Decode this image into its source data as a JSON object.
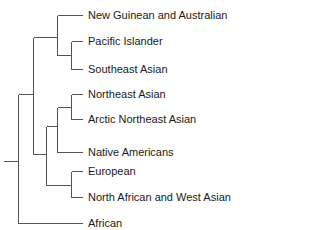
{
  "diagram": {
    "type": "phylogenetic-tree",
    "line_color": "#555555",
    "text_color": "#1a1a1a",
    "leaves": [
      {
        "label": "New Guinean and Australian",
        "y": 15
      },
      {
        "label": "Pacific Islander",
        "y": 42
      },
      {
        "label": "Southeast Asian",
        "y": 69
      },
      {
        "label": "Northeast Asian",
        "y": 94
      },
      {
        "label": "Arctic Northeast Asian",
        "y": 119
      },
      {
        "label": "Native Americans",
        "y": 152
      },
      {
        "label": "European",
        "y": 171
      },
      {
        "label": "North African and West Asian",
        "y": 197
      },
      {
        "label": "African",
        "y": 223
      }
    ],
    "structure": "((New Guinean and Australian,(Pacific Islander,Southeast Asian)),(((Northeast Asian,Arctic Northeast Asian),Native Americans),(European,North African and West Asian))),African"
  }
}
